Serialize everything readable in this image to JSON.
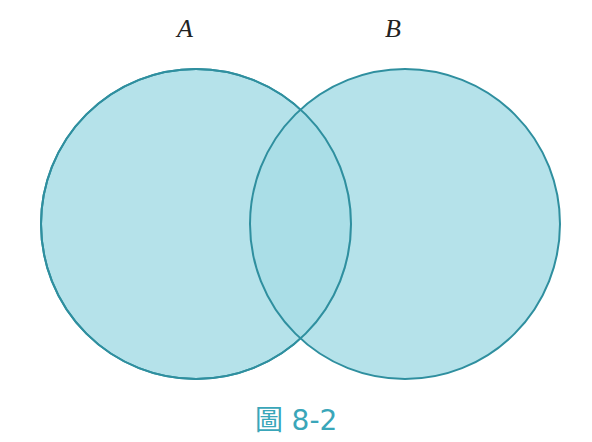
{
  "diagram": {
    "type": "venn",
    "sets": [
      {
        "label": "A",
        "cx": 196,
        "cy": 224,
        "r": 155
      },
      {
        "label": "B",
        "cx": 405,
        "cy": 224,
        "r": 155
      }
    ],
    "colors": {
      "fill": "#a8dde6",
      "fill_opacity": "0.85",
      "stroke": "#2f8f9f",
      "caption": "#3aa6b9"
    }
  },
  "caption": "圖 8-2"
}
